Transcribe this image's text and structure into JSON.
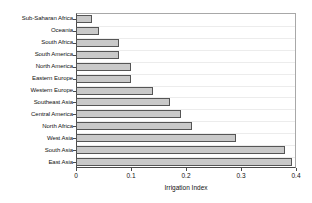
{
  "chart_data": {
    "type": "bar",
    "orientation": "horizontal",
    "title": "",
    "xlabel": "Irrigation Index",
    "ylabel": "",
    "xlim": [
      0,
      0.4
    ],
    "xticks": [
      "0",
      "0.1",
      "0.2",
      "0.3",
      "0.4"
    ],
    "xtick_values": [
      0,
      0.1,
      0.2,
      0.3,
      0.4
    ],
    "grid": "horizontal",
    "legend": "none",
    "bar_color": "#c9c9c9",
    "bar_edge_color": "#555555",
    "axis_color": "#4a4a4a",
    "gridline_color": "#ececec",
    "categories": [
      "Sub-Saharan Africa",
      "Oceania",
      "South Africa",
      "South America",
      "North America",
      "Eastern Europe",
      "Western Europe",
      "Southeast Asia",
      "Central America",
      "North Africa",
      "West Asia",
      "South Asia",
      "East Asia"
    ],
    "values": [
      0.029,
      0.041,
      0.078,
      0.078,
      0.1,
      0.1,
      0.14,
      0.17,
      0.19,
      0.21,
      0.29,
      0.38,
      0.392
    ]
  }
}
